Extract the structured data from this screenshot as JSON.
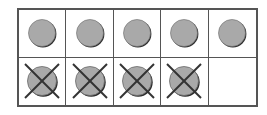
{
  "ten_frame": {
    "rows": 2,
    "columns": 5,
    "colors": {
      "frame_border": "#555555",
      "counter_fill": "#a9a9a9",
      "counter_shadow": "#2b2b2b",
      "cross_line": "#333333"
    },
    "cells": [
      {
        "row": 0,
        "col": 0,
        "state": "counter"
      },
      {
        "row": 0,
        "col": 1,
        "state": "counter"
      },
      {
        "row": 0,
        "col": 2,
        "state": "counter"
      },
      {
        "row": 0,
        "col": 3,
        "state": "counter"
      },
      {
        "row": 0,
        "col": 4,
        "state": "counter"
      },
      {
        "row": 1,
        "col": 0,
        "state": "crossed-counter"
      },
      {
        "row": 1,
        "col": 1,
        "state": "crossed-counter"
      },
      {
        "row": 1,
        "col": 2,
        "state": "crossed-counter"
      },
      {
        "row": 1,
        "col": 3,
        "state": "crossed-counter"
      },
      {
        "row": 1,
        "col": 4,
        "state": "empty"
      }
    ],
    "summary": {
      "total_counters": 9,
      "crossed_out": 4,
      "remaining": 5
    }
  }
}
